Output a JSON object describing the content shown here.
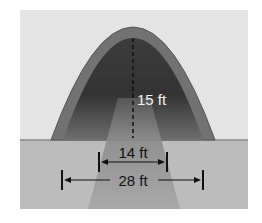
{
  "diagram": {
    "type": "parabolic-arch-over-road",
    "labels": {
      "height": "15 ft",
      "inner_width": "14 ft",
      "outer_width": "28 ft"
    },
    "colors": {
      "background": "#e6e6e6",
      "ground": "#b9b9b9",
      "arch_band": "#707070",
      "arch_inner_dark": "#3a3a3a",
      "road": "#9a9a9a",
      "line": "#111111",
      "height_label": "#f2f2f2"
    }
  }
}
